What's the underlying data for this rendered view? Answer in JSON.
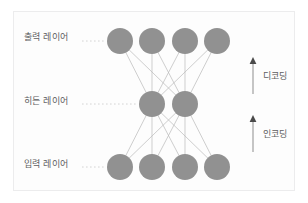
{
  "figure": {
    "background_color": "#fdfdfd",
    "frame_color": "#ececed"
  },
  "layers": [
    {
      "id": "output",
      "label": "출력 레이어",
      "node_count": 4,
      "cy": 41,
      "node_centers_x": [
        120,
        152,
        185,
        217
      ]
    },
    {
      "id": "hidden",
      "label": "히든 레이어",
      "node_count": 2,
      "cy": 104,
      "node_centers_x": [
        152,
        185
      ]
    },
    {
      "id": "input",
      "label": "입력 레이어",
      "node_count": 4,
      "cy": 167,
      "node_centers_x": [
        120,
        152,
        185,
        217
      ]
    }
  ],
  "node_style": {
    "radius": 13,
    "fill": "#919191",
    "stroke": "none"
  },
  "edge_style": {
    "stroke": "#b9b9b9",
    "width": 0.7,
    "fully_connected": true
  },
  "leader_style": {
    "stroke": "#cfcfcf",
    "dash": "1.6 2.4"
  },
  "annotations": [
    {
      "id": "decoding",
      "label": "디코딩",
      "icon": "arrow-up-icon",
      "direction": "up",
      "arrow_x": 253,
      "arrow_top": 57,
      "arrow_bottom": 94,
      "description": "히든 레이어에서 출력 레이어로"
    },
    {
      "id": "encoding",
      "label": "인코딩",
      "icon": "arrow-up-icon",
      "direction": "up",
      "arrow_x": 253,
      "arrow_top": 115,
      "arrow_bottom": 152,
      "description": "입력 레이어에서 히든 레이어로"
    }
  ],
  "colors": {
    "node": "#919191",
    "edge": "#b9b9b9",
    "text": "#5d5d5f",
    "arrow": "#8d8d8d",
    "leader": "#cfcfcf"
  }
}
